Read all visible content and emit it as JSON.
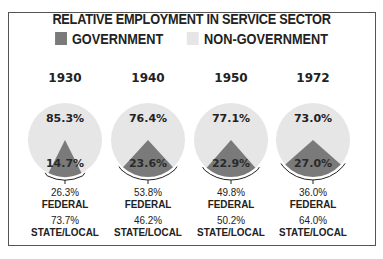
{
  "title": "RELATIVE EMPLOYMENT IN SERVICE SECTOR",
  "legend": [
    {
      "label": "GOVERNMENT",
      "color": "#7a7a7a"
    },
    {
      "label": "NON-GOVERNMENT",
      "color": "#e6e6e6"
    }
  ],
  "chart_data": {
    "type": "pie",
    "title": "RELATIVE EMPLOYMENT IN SERVICE SECTOR",
    "legend": [
      "GOVERNMENT",
      "NON-GOVERNMENT"
    ],
    "charts": [
      {
        "year": "1930",
        "government": 14.7,
        "non_government": 85.3,
        "federal": 26.3,
        "state_local": 73.7
      },
      {
        "year": "1940",
        "government": 23.6,
        "non_government": 76.4,
        "federal": 53.8,
        "state_local": 46.2
      },
      {
        "year": "1950",
        "government": 22.9,
        "non_government": 77.1,
        "federal": 49.8,
        "state_local": 50.2
      },
      {
        "year": "1972",
        "government": 27.0,
        "non_government": 73.0,
        "federal": 36.0,
        "state_local": 64.0
      }
    ]
  },
  "pies": [
    {
      "year": "1930",
      "non_gov_label": "85.3%",
      "gov_label": "14.7%",
      "federal_value": "26.3%",
      "federal_label": "FEDERAL",
      "state_value": "73.7%",
      "state_label": "STATE/LOCAL"
    },
    {
      "year": "1940",
      "non_gov_label": "76.4%",
      "gov_label": "23.6%",
      "federal_value": "53.8%",
      "federal_label": "FEDERAL",
      "state_value": "46.2%",
      "state_label": "STATE/LOCAL"
    },
    {
      "year": "1950",
      "non_gov_label": "77.1%",
      "gov_label": "22.9%",
      "federal_value": "49.8%",
      "federal_label": "FEDERAL",
      "state_value": "50.2%",
      "state_label": "STATE/LOCAL"
    },
    {
      "year": "1972",
      "non_gov_label": "73.0%",
      "gov_label": "27.0%",
      "federal_value": "36.0%",
      "federal_label": "FEDERAL",
      "state_value": "64.0%",
      "state_label": "STATE/LOCAL"
    }
  ]
}
